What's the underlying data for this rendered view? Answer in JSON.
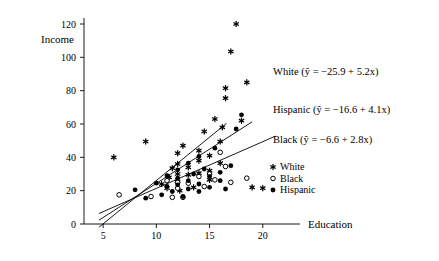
{
  "chart_data": {
    "type": "scatter",
    "title": "",
    "xlabel": "Education",
    "ylabel": "Income",
    "xlim": [
      3.2,
      23.5
    ],
    "ylim": [
      0,
      128
    ],
    "xticks": [
      5,
      10,
      15,
      20
    ],
    "yticks": [
      0,
      20,
      40,
      60,
      80,
      100,
      120
    ],
    "grid": false,
    "legend_position": "right-middle",
    "legend": [
      {
        "name": "White",
        "marker": "asterisk"
      },
      {
        "name": "Black",
        "marker": "open-circle"
      },
      {
        "name": "Hispanic",
        "marker": "filled-circle"
      }
    ],
    "series": [
      {
        "name": "White",
        "marker": "asterisk",
        "fit_label": "White (ŷ = −25.9 + 5.2x)",
        "fit_intercept": -25.9,
        "fit_slope": 5.2,
        "points": [
          [
            6.0,
            40.0
          ],
          [
            9.0,
            49.5
          ],
          [
            10.5,
            24.0
          ],
          [
            11.0,
            21.5
          ],
          [
            11.2,
            28.0
          ],
          [
            11.5,
            33.5
          ],
          [
            12.0,
            25.5
          ],
          [
            12.0,
            30.0
          ],
          [
            12.0,
            36.0
          ],
          [
            12.0,
            42.5
          ],
          [
            12.2,
            20.0
          ],
          [
            12.5,
            47.0
          ],
          [
            13.0,
            29.5
          ],
          [
            13.0,
            34.0
          ],
          [
            13.5,
            22.0
          ],
          [
            14.0,
            30.5
          ],
          [
            14.0,
            38.0
          ],
          [
            14.0,
            44.0
          ],
          [
            14.5,
            55.5
          ],
          [
            15.0,
            26.5
          ],
          [
            15.0,
            32.0
          ],
          [
            15.0,
            41.0
          ],
          [
            15.5,
            63.0
          ],
          [
            16.0,
            36.5
          ],
          [
            16.0,
            49.5
          ],
          [
            16.2,
            58.0
          ],
          [
            16.5,
            75.5
          ],
          [
            16.5,
            81.5
          ],
          [
            17.0,
            103.5
          ],
          [
            17.5,
            120.0
          ],
          [
            18.0,
            62.0
          ],
          [
            18.5,
            85.0
          ],
          [
            19.0,
            22.0
          ],
          [
            20.0,
            21.5
          ]
        ]
      },
      {
        "name": "Black",
        "marker": "open-circle",
        "fit_label": "Black (ŷ = −6.6 + 2.8x)",
        "fit_intercept": -6.6,
        "fit_slope": 2.8,
        "points": [
          [
            6.5,
            17.5
          ],
          [
            9.5,
            16.5
          ],
          [
            11.0,
            26.0
          ],
          [
            11.5,
            16.0
          ],
          [
            12.0,
            25.0
          ],
          [
            12.0,
            21.5
          ],
          [
            12.5,
            16.0
          ],
          [
            13.0,
            24.5
          ],
          [
            14.0,
            28.5
          ],
          [
            14.5,
            22.5
          ],
          [
            15.0,
            30.0
          ],
          [
            15.5,
            26.5
          ],
          [
            16.0,
            43.0
          ],
          [
            16.5,
            34.5
          ],
          [
            17.0,
            25.0
          ],
          [
            18.5,
            27.5
          ]
        ]
      },
      {
        "name": "Hispanic",
        "marker": "filled-circle",
        "fit_label": "Hispanic (ŷ = −16.6 + 4.1x)",
        "fit_intercept": -16.6,
        "fit_slope": 4.1,
        "points": [
          [
            8.0,
            20.5
          ],
          [
            9.0,
            15.5
          ],
          [
            10.0,
            24.5
          ],
          [
            10.5,
            17.5
          ],
          [
            11.0,
            22.5
          ],
          [
            11.0,
            29.0
          ],
          [
            11.5,
            19.5
          ],
          [
            12.0,
            23.5
          ],
          [
            12.0,
            27.5
          ],
          [
            12.0,
            32.5
          ],
          [
            12.5,
            16.5
          ],
          [
            13.0,
            21.0
          ],
          [
            13.0,
            26.0
          ],
          [
            13.0,
            36.5
          ],
          [
            13.5,
            30.0
          ],
          [
            14.0,
            19.5
          ],
          [
            14.0,
            24.0
          ],
          [
            14.0,
            40.5
          ],
          [
            14.5,
            33.0
          ],
          [
            15.0,
            22.0
          ],
          [
            15.0,
            28.5
          ],
          [
            15.5,
            45.5
          ],
          [
            16.0,
            26.0
          ],
          [
            16.0,
            31.0
          ],
          [
            16.5,
            21.0
          ],
          [
            17.0,
            35.0
          ],
          [
            17.5,
            57.0
          ],
          [
            18.0,
            65.5
          ]
        ]
      }
    ]
  },
  "axis": {
    "y_title": "Income",
    "x_title": "Education"
  }
}
